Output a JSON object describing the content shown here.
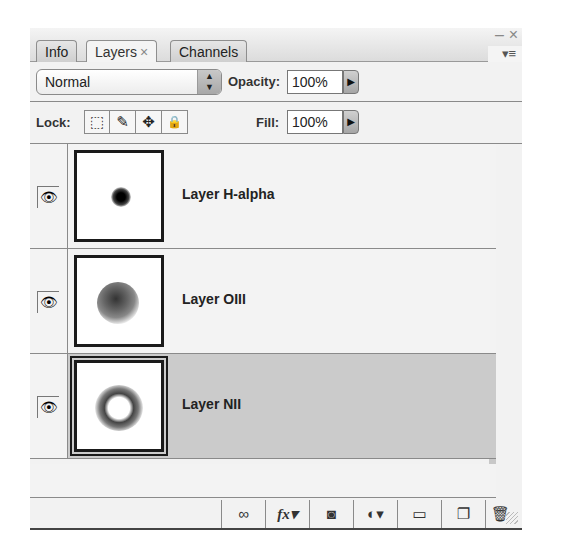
{
  "panel": {
    "tabs": [
      {
        "label": "Info",
        "active": false
      },
      {
        "label": "Layers",
        "active": true,
        "close": "×"
      },
      {
        "label": "Channels",
        "active": false
      }
    ],
    "window_controls": {
      "minimize": "–",
      "close": "×",
      "menu": "▾≡"
    }
  },
  "blend_mode": {
    "selected": "Normal",
    "stepper": "▲▼"
  },
  "opacity": {
    "label": "Opacity:",
    "value": "100%",
    "arrow": "▶"
  },
  "lock": {
    "label": "Lock:",
    "icons": [
      {
        "name": "lock-transparent-pixels-icon",
        "glyph": "⬚"
      },
      {
        "name": "lock-image-pixels-icon",
        "glyph": "✎"
      },
      {
        "name": "lock-position-icon",
        "glyph": "✥"
      },
      {
        "name": "lock-all-icon",
        "glyph": "🔒"
      }
    ]
  },
  "fill": {
    "label": "Fill:",
    "value": "100%",
    "arrow": "▶"
  },
  "layers": [
    {
      "name": "Layer H-alpha",
      "visible": true,
      "selected": false,
      "eye": "👁"
    },
    {
      "name": "Layer OIII",
      "visible": true,
      "selected": false,
      "eye": "👁"
    },
    {
      "name": "Layer NII",
      "visible": true,
      "selected": true,
      "eye": "👁"
    }
  ],
  "footer": {
    "buttons": [
      {
        "name": "link-layers-icon",
        "glyph": "∞"
      },
      {
        "name": "fx-icon",
        "glyph": "fx▾"
      },
      {
        "name": "layer-mask-icon",
        "glyph": "◙"
      },
      {
        "name": "adjustment-layer-icon",
        "glyph": "◐▾"
      },
      {
        "name": "new-group-icon",
        "glyph": "▭"
      },
      {
        "name": "new-layer-icon",
        "glyph": "❐"
      },
      {
        "name": "trash-icon",
        "glyph": "🗑"
      }
    ]
  }
}
